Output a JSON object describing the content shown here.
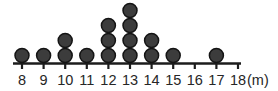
{
  "chart_data": {
    "type": "scatter",
    "plot_style": "dot-plot",
    "title": "",
    "subtitle": "",
    "xlabel": "",
    "ylabel": "",
    "unit_label": "(m)",
    "categories": [
      "8",
      "9",
      "10",
      "11",
      "12",
      "13",
      "14",
      "15",
      "16",
      "17",
      "18"
    ],
    "values": [
      1,
      1,
      2,
      1,
      3,
      4,
      2,
      1,
      0,
      1,
      0
    ],
    "series": [
      {
        "name": "count",
        "values": [
          1,
          1,
          2,
          1,
          3,
          4,
          2,
          1,
          0,
          1,
          0
        ]
      }
    ],
    "xlim": [
      8,
      18
    ],
    "ylim": [
      0,
      4
    ],
    "grid": false,
    "legend": false,
    "total_count": 16,
    "dot_color": "#3c3c3c",
    "dot_outline_color": "#141414",
    "axis_color": "#1c1c1c",
    "label_color": "#262626",
    "background_color": "#ffffff"
  },
  "axis": {
    "tick_labels": [
      "8",
      "9",
      "10",
      "11",
      "12",
      "13",
      "14",
      "15",
      "16",
      "17",
      "18"
    ],
    "unit": "(m)"
  }
}
